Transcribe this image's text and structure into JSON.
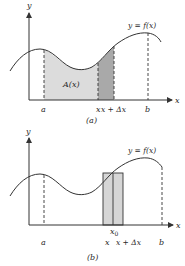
{
  "colors": {
    "stroke": "#333333",
    "area_fill": "#dcdcdc",
    "strip_fill": "#a9a9a9",
    "rect_fill": "#d6d6d6",
    "background": "#ffffff"
  },
  "panel_a": {
    "caption": "(a)",
    "y_axis_label": "y",
    "x_axis_label": "x",
    "curve_label": "y = f(x)",
    "area_label": "A(x)",
    "tick_labels": {
      "a": "a",
      "x": "x",
      "x_plus_dx": "x + Δx",
      "b": "b"
    }
  },
  "panel_b": {
    "caption": "(b)",
    "y_axis_label": "y",
    "x_axis_label": "x",
    "curve_label": "y = f(x)",
    "point_label": "x",
    "point_subscript": "0",
    "tick_labels": {
      "a": "a",
      "x": "x",
      "x_plus_dx": "x + Δx",
      "b": "b"
    }
  }
}
